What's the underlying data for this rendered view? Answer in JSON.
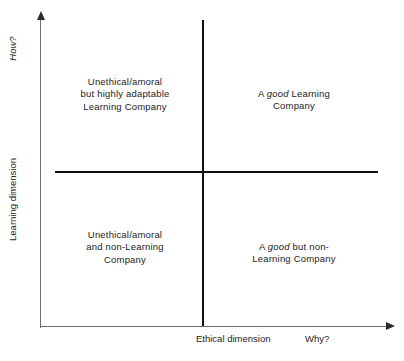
{
  "diagram": {
    "type": "2x2-matrix",
    "axes": {
      "x": {
        "title": "Ethical dimension",
        "question": "Why?",
        "arrow": "arrow-right-icon"
      },
      "y": {
        "title": "Learning dimension",
        "question": "How?",
        "arrow": "arrow-up-icon"
      }
    },
    "quadrants": [
      {
        "position": "top-left",
        "lines": [
          "Unethical/amoral",
          "but highly adaptable",
          "Learning Company"
        ],
        "emphasis": []
      },
      {
        "position": "top-right",
        "lines": [
          "A good Learning",
          "Company"
        ],
        "emphasis": [
          "good"
        ]
      },
      {
        "position": "bottom-left",
        "lines": [
          "Unethical/amoral",
          "and non-Learning",
          "Company"
        ],
        "emphasis": []
      },
      {
        "position": "bottom-right",
        "lines": [
          "A good but non-",
          "Learning Company"
        ],
        "emphasis": [
          "good"
        ]
      }
    ],
    "colors": {
      "background": "#ffffff",
      "text": "#232323",
      "divider": "#111111",
      "axis": "#6e6e6e"
    }
  }
}
